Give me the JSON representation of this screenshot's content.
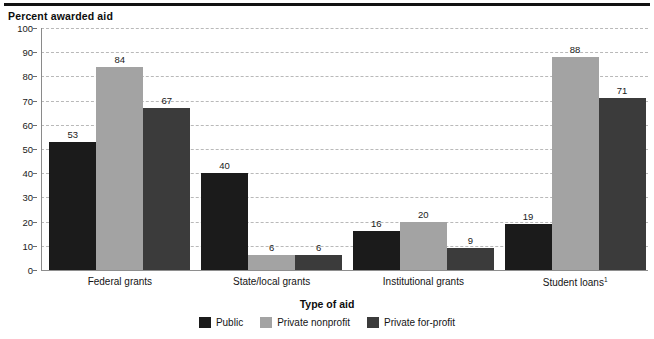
{
  "figure": {
    "y_axis_title": "Percent awarded aid",
    "x_axis_title": "Type of aid",
    "legend_title": "Type of aid"
  },
  "chart_data": {
    "type": "bar",
    "title": "",
    "ylabel": "Percent awarded aid",
    "xlabel": "Type of aid",
    "ylim": [
      0,
      100
    ],
    "yticks": [
      0,
      10,
      20,
      30,
      40,
      50,
      60,
      70,
      80,
      90,
      100
    ],
    "ytick_labels": [
      "0",
      "10",
      "20",
      "30",
      "40",
      "50",
      "60",
      "70",
      "80",
      "90",
      "100"
    ],
    "grid": true,
    "grid_style": "dashed",
    "legend_position": "bottom-center",
    "categories": [
      "Federal grants",
      "State/local grants",
      "Institutional grants",
      "Student loans"
    ],
    "category_labels": [
      "Federal grants",
      "State/local grants",
      "Institutional grants",
      "Student loans¹"
    ],
    "category_footnotes": [
      "",
      "",
      "",
      "1"
    ],
    "series": [
      {
        "name": "Public",
        "color": "#1b1b1b",
        "values": [
          53,
          40,
          16,
          19
        ],
        "value_labels": [
          "53",
          "40",
          "16",
          "19"
        ]
      },
      {
        "name": "Private nonprofit",
        "color": "#a3a3a3",
        "values": [
          84,
          6,
          20,
          88
        ],
        "value_labels": [
          "84",
          "6",
          "20",
          "88"
        ]
      },
      {
        "name": "Private for-profit",
        "color": "#3b3b3b",
        "values": [
          67,
          6,
          9,
          71
        ],
        "value_labels": [
          "67",
          "6",
          "9",
          "71"
        ]
      }
    ]
  }
}
